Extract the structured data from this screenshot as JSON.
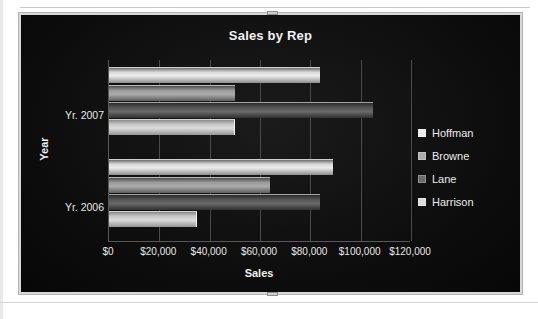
{
  "document": {
    "background_color": "#ffffff"
  },
  "chart_object": {
    "selected": true,
    "handle_top_name": "top-resize-handle",
    "handle_bottom_name": "bottom-resize-handle"
  },
  "chart_data": {
    "type": "bar",
    "orientation": "horizontal",
    "title": "Sales by Rep",
    "xlabel": "Sales",
    "ylabel": "Year",
    "categories": [
      "Yr. 2007",
      "Yr. 2006"
    ],
    "series": [
      {
        "name": "Hoffman",
        "values": [
          84000,
          89000
        ],
        "color": "#ededed"
      },
      {
        "name": "Browne",
        "values": [
          50000,
          64000
        ],
        "color": "#acacac"
      },
      {
        "name": "Lane",
        "values": [
          105000,
          84000
        ],
        "color": "#6a6a6a"
      },
      {
        "name": "Harrison",
        "values": [
          50000,
          35000
        ],
        "color": "#dcdcdc"
      }
    ],
    "xlim": [
      0,
      120000
    ],
    "xticks": [
      0,
      20000,
      40000,
      60000,
      80000,
      100000,
      120000
    ],
    "xtick_labels": [
      "$0",
      "$20,000",
      "$40,000",
      "$60,000",
      "$80,000",
      "$100,000",
      "$120,000"
    ],
    "grid": true,
    "grid_axis": "x",
    "legend_position": "right",
    "plot_background": "#151515",
    "chart_background": "#0d0d0d",
    "text_color": "#efefef"
  }
}
